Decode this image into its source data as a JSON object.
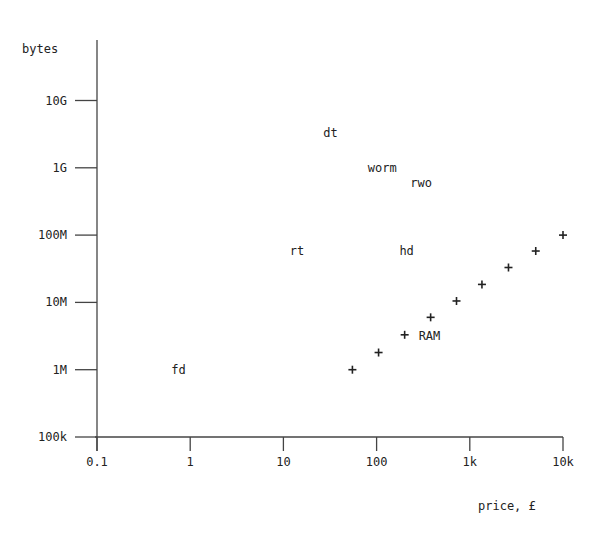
{
  "chart_data": {
    "type": "scatter",
    "title": "",
    "xlabel": "price, £",
    "ylabel": "bytes",
    "xscale": "log",
    "yscale": "log",
    "xlim": [
      0.1,
      10000
    ],
    "ylim": [
      100000,
      10000000000
    ],
    "grid": false,
    "legend": null,
    "x_ticks": [
      {
        "value": 0.1,
        "label": "0.1"
      },
      {
        "value": 1,
        "label": "1"
      },
      {
        "value": 10,
        "label": "10"
      },
      {
        "value": 100,
        "label": "100"
      },
      {
        "value": 1000,
        "label": "1k"
      },
      {
        "value": 10000,
        "label": "10k"
      }
    ],
    "y_ticks": [
      {
        "value": 100000,
        "label": "100k"
      },
      {
        "value": 1000000,
        "label": "1M"
      },
      {
        "value": 10000000,
        "label": "10M"
      },
      {
        "value": 100000000,
        "label": "100M"
      },
      {
        "value": 1000000000,
        "label": "1G"
      },
      {
        "value": 10000000000,
        "label": "10G"
      }
    ],
    "series": [
      {
        "name": "RAM",
        "marker": "+",
        "label": "RAM",
        "points": [
          {
            "x": 55,
            "y": 1000000
          },
          {
            "x": 105,
            "y": 1800000
          },
          {
            "x": 200,
            "y": 3300000
          },
          {
            "x": 380,
            "y": 6000000
          },
          {
            "x": 720,
            "y": 10500000
          },
          {
            "x": 1350,
            "y": 18500000
          },
          {
            "x": 2600,
            "y": 33000000
          },
          {
            "x": 5100,
            "y": 58000000
          },
          {
            "x": 10000,
            "y": 100000000
          }
        ]
      }
    ],
    "annotations": [
      {
        "text": "fd",
        "x": 0.75,
        "y": 1000000
      },
      {
        "text": "rt",
        "x": 14,
        "y": 58000000
      },
      {
        "text": "dt",
        "x": 32,
        "y": 3300000000
      },
      {
        "text": "worm",
        "x": 115,
        "y": 1000000000
      },
      {
        "text": "rwo",
        "x": 300,
        "y": 600000000
      },
      {
        "text": "hd",
        "x": 210,
        "y": 58000000
      }
    ]
  }
}
